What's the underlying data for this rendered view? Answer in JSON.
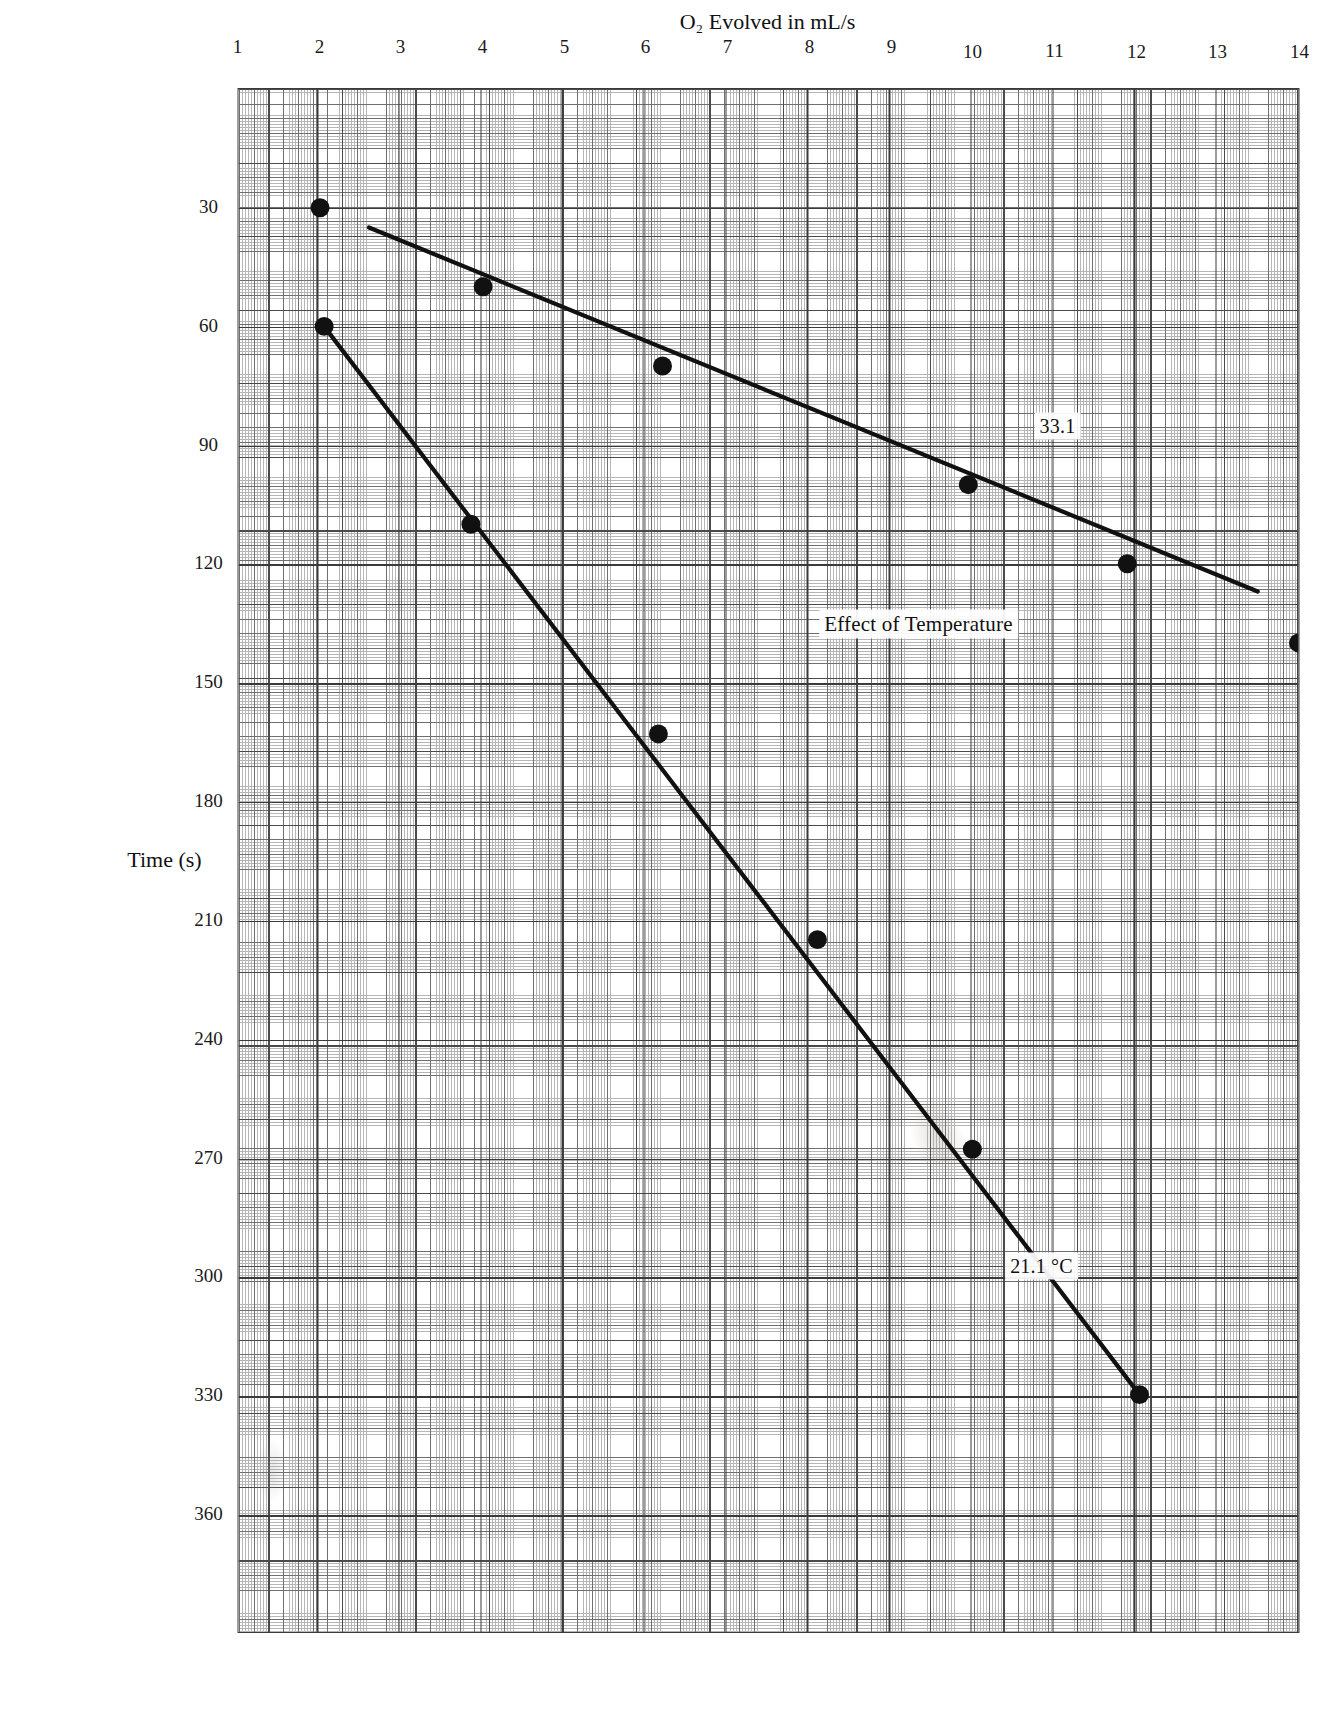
{
  "chart_data": {
    "type": "scatter",
    "title": "Effect of Temperature",
    "xlabel": "Time (s)",
    "ylabel": "O2 Evolved in mL/s",
    "ylabel_display": "O₂ Evolved in mL/s",
    "xlim": [
      0,
      390
    ],
    "ylim": [
      1,
      14
    ],
    "xticks": [
      30,
      60,
      90,
      120,
      150,
      180,
      210,
      240,
      270,
      300,
      330,
      360
    ],
    "yticks": [
      1,
      2,
      3,
      4,
      5,
      6,
      7,
      8,
      9,
      10,
      11,
      12,
      13,
      14
    ],
    "grid": true,
    "grid_style": "engineering graph paper, minor divisions",
    "legend_position": "inline annotations",
    "series": [
      {
        "name": "33.1",
        "label": "33.1",
        "annotation": "33.1",
        "points": [
          {
            "x": 30,
            "y": 2.0
          },
          {
            "x": 50,
            "y": 4.0
          },
          {
            "x": 70,
            "y": 6.2
          },
          {
            "x": 100,
            "y": 9.95
          },
          {
            "x": 120,
            "y": 11.9
          },
          {
            "x": 140,
            "y": 14.0
          }
        ],
        "fit_line": {
          "x1": 35,
          "y1": 2.6,
          "x2": 127,
          "y2": 13.5
        }
      },
      {
        "name": "21.1 °C",
        "label": "21.1 °C",
        "annotation": "21.1 °C",
        "points": [
          {
            "x": 60,
            "y": 2.05
          },
          {
            "x": 110,
            "y": 3.85
          },
          {
            "x": 163,
            "y": 6.15
          },
          {
            "x": 215,
            "y": 8.1
          },
          {
            "x": 268,
            "y": 10.0
          },
          {
            "x": 330,
            "y": 12.05
          }
        ],
        "fit_line": {
          "x1": 60,
          "y1": 2.05,
          "x2": 330,
          "y2": 12.05
        }
      }
    ]
  },
  "axes": {
    "x_title": "Time (s)",
    "y_title": "O₂ Evolved in mL/s",
    "x_tick_labels": [
      "30",
      "60",
      "90",
      "120",
      "150",
      "180",
      "210",
      "240",
      "270",
      "300",
      "330",
      "360"
    ],
    "y_tick_labels": [
      "1",
      "2",
      "3",
      "4",
      "5",
      "6",
      "7",
      "8",
      "9",
      "10",
      "11",
      "12",
      "13",
      "14"
    ]
  },
  "annotations": {
    "title": "Effect of Temperature",
    "series_a": "33.1",
    "series_b": "21.1 °C"
  },
  "colors": {
    "ink": "#111111",
    "grid_major": "#4a4a4a",
    "grid_mid": "#6f6f6f",
    "grid_minor": "#b6b6b6",
    "paper": "#ffffff"
  }
}
